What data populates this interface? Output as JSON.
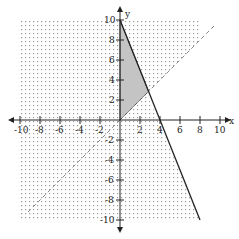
{
  "graph": {
    "x_axis_label": "x",
    "y_axis_label": "y",
    "x_ticks": [
      "-10",
      "-8",
      "-6",
      "-4",
      "-2",
      "2",
      "4",
      "6",
      "8",
      "10"
    ],
    "y_ticks": [
      "10",
      "8",
      "6",
      "4",
      "2",
      "-2",
      "-4",
      "-6",
      "-8",
      "-10"
    ],
    "range": {
      "xmin": -10,
      "xmax": 10,
      "ymin": -10,
      "ymax": 10
    },
    "lines": [
      {
        "name": "solid-boundary",
        "equation": "y = -2.5x + 10",
        "style": "solid"
      },
      {
        "name": "dashed-boundary",
        "equation": "y = x",
        "style": "dashed"
      }
    ],
    "shaded_region_vertices": [
      [
        0,
        0
      ],
      [
        0,
        10
      ],
      [
        2.86,
        2.86
      ]
    ],
    "colors": {
      "shade": "#c8c8c8",
      "line": "#222222",
      "dots": "#999999"
    }
  }
}
